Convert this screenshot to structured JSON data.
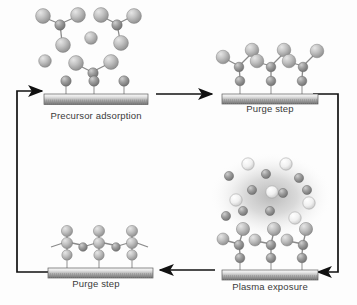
{
  "figure": {
    "type": "diagram",
    "background_color": "#fdfdfd",
    "ink_color": "#111111"
  },
  "steps": [
    {
      "id": "precursor-adsorption",
      "label": "Precursor adsorption",
      "position": "top-left",
      "description": "Free precursor molecules in the gas phase above a substrate with three adsorbed ligand groups"
    },
    {
      "id": "purge-step-top",
      "label": "Purge step",
      "position": "top-right",
      "description": "Gas phase cleared, chemisorbed precursor fragments remain bound to the substrate"
    },
    {
      "id": "plasma-exposure",
      "label": "Plasma exposure",
      "position": "bottom-right",
      "description": "Radical and ion species within a glowing plasma cloud react with the adsorbed layer"
    },
    {
      "id": "purge-step-bottom",
      "label": "Purge step",
      "position": "bottom-left",
      "description": "Reaction by-products removed leaving a completed monolayer of film on the substrate"
    }
  ],
  "arrows": [
    {
      "id": "arrow-top",
      "from": "precursor-adsorption",
      "to": "purge-step-top",
      "direction": "right"
    },
    {
      "id": "arrow-right",
      "from": "purge-step-top",
      "to": "plasma-exposure",
      "direction": "down-left"
    },
    {
      "id": "arrow-bottom",
      "from": "plasma-exposure",
      "to": "purge-step-bottom",
      "direction": "left"
    },
    {
      "id": "arrow-left",
      "from": "purge-step-bottom",
      "to": "precursor-adsorption",
      "direction": "up-right"
    }
  ],
  "legend_colors": {
    "atom_large": "#b9b9b9",
    "atom_small": "#8e8e8e",
    "atom_bright": "#efefef",
    "substrate_top": "#f2f2f2",
    "substrate_bottom": "#6f6f6f",
    "plasma_glow": "#9a9a9a",
    "caption_text": "#3a3a3a"
  }
}
